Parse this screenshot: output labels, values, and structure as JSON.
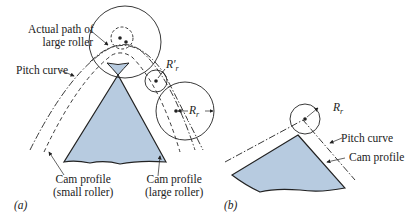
{
  "panel_a": {
    "tag": "(a)",
    "labels": {
      "actual_path_line1": "Actual path of",
      "actual_path_line2": "large roller",
      "pitch_curve": "Pitch curve",
      "r_prime": "R′",
      "r_prime_sub": "r",
      "r": "R",
      "r_sub": "r",
      "cam_small_line1": "Cam profile",
      "cam_small_line2": "(small roller)",
      "cam_large_line1": "Cam profile",
      "cam_large_line2": "(large roller)"
    }
  },
  "panel_b": {
    "tag": "(b)",
    "labels": {
      "r": "R",
      "r_sub": "r",
      "pitch_curve": "Pitch curve",
      "cam_profile": "Cam profile"
    }
  },
  "colors": {
    "cam_fill": "#b7cbe0",
    "line": "#222222"
  }
}
